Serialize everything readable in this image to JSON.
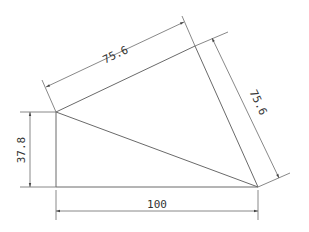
{
  "diagram": {
    "type": "technical-drawing",
    "shape": "quadrilateral with diagonal",
    "points": {
      "A": [
        56,
        112
      ],
      "B": [
        56,
        187
      ],
      "C": [
        258,
        187
      ],
      "D": [
        195,
        46
      ]
    },
    "dimensions": {
      "top_edge": "75.6",
      "right_edge": "75.6",
      "left_height": "37.8",
      "bottom_width": "100"
    },
    "colors": {
      "line": "#6a6a6a",
      "text": "#333333",
      "background": "#ffffff"
    }
  }
}
